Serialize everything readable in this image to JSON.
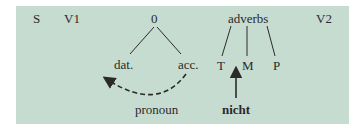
{
  "diagram": {
    "background": "#c6dcd1",
    "ink": "#2a2a2a",
    "labels": {
      "s": "S",
      "v1": "V1",
      "zero": "0",
      "adverbs": "adverbs",
      "v2": "V2",
      "dat": "dat.",
      "acc": "acc.",
      "t": "T",
      "m": "M",
      "p": "P",
      "pronoun": "pronoun",
      "nicht": "nicht"
    }
  }
}
